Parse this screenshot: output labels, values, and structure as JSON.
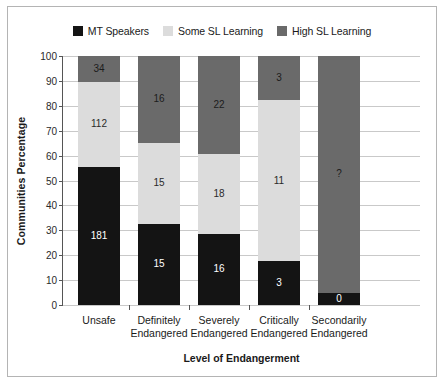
{
  "chart_data": {
    "type": "bar",
    "subtype": "stacked-bar-100-percent",
    "title": "",
    "xlabel": "Level of Endangerment",
    "ylabel": "Communities Percentage",
    "ylim": [
      0,
      100
    ],
    "yticks": [
      0,
      10,
      20,
      30,
      40,
      50,
      60,
      70,
      80,
      90,
      100
    ],
    "ytick_labels": [
      "0",
      "10",
      "20",
      "30",
      "40",
      "50",
      "60",
      "70",
      "80",
      "90",
      "100"
    ],
    "grid": true,
    "legend_position": "top-center",
    "categories": [
      "Unsafe",
      "Definitely Endangered",
      "Severely Endangered",
      "Critically Endangered",
      "Secondarily Endangered"
    ],
    "category_lines": [
      [
        "Unsafe",
        ""
      ],
      [
        "Definitely",
        "Endangered"
      ],
      [
        "Severely",
        "Endangered"
      ],
      [
        "Critically",
        "Endangered"
      ],
      [
        "Secondarily",
        "Endangered"
      ]
    ],
    "series": [
      {
        "name": "MT Speakers",
        "color": "#141414",
        "labels": [
          "181",
          "15",
          "16",
          "3",
          "0"
        ],
        "values": [
          181,
          15,
          16,
          3,
          0
        ],
        "percent": [
          55.4,
          32.6,
          28.6,
          17.6,
          5.0
        ]
      },
      {
        "name": "Some SL Learning",
        "color": "#dcdcdc",
        "labels": [
          "112",
          "15",
          "18",
          "11",
          ""
        ],
        "values": [
          112,
          15,
          18,
          11,
          0
        ],
        "percent": [
          34.2,
          32.6,
          32.2,
          64.8,
          0
        ]
      },
      {
        "name": "High SL Learning",
        "color": "#6a6a6a",
        "labels": [
          "34",
          "16",
          "22",
          "3",
          "?"
        ],
        "values": [
          34,
          16,
          22,
          3,
          null
        ],
        "percent": [
          10.4,
          34.8,
          39.2,
          17.6,
          95.0
        ]
      }
    ]
  },
  "legend": {
    "items": [
      {
        "label": "MT Speakers",
        "color": "#141414",
        "swatch": "legend-swatch-mt-speakers"
      },
      {
        "label": "Some SL Learning",
        "color": "#dcdcdc",
        "swatch": "legend-swatch-some-sl-learning"
      },
      {
        "label": "High SL Learning",
        "color": "#6a6a6a",
        "swatch": "legend-swatch-high-sl-learning"
      }
    ]
  },
  "colors": {
    "mt_speakers": "#141414",
    "some_sl_learning": "#dcdcdc",
    "high_sl_learning": "#6a6a6a",
    "gridline": "#c9c9c9",
    "axis": "#555555",
    "frame": "#b4b4b4",
    "background": "#ffffff",
    "text": "#1a1a1a"
  }
}
